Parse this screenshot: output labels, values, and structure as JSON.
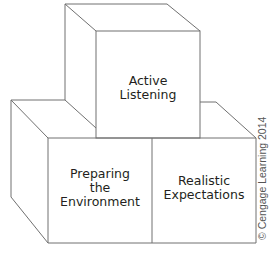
{
  "diagram": {
    "type": "stacked-blocks",
    "stroke_color": "#707070",
    "text_color": "#231f20",
    "blocks": [
      {
        "id": "top",
        "position": "top",
        "label_lines": [
          "Active",
          "Listening"
        ]
      },
      {
        "id": "bottom-left",
        "position": "bottom-left",
        "label_lines": [
          "Preparing",
          "the",
          "Environment"
        ]
      },
      {
        "id": "bottom-right",
        "position": "bottom-right",
        "label_lines": [
          "Realistic",
          "Expectations"
        ]
      }
    ]
  },
  "credit": "© Cengage Learning 2014"
}
